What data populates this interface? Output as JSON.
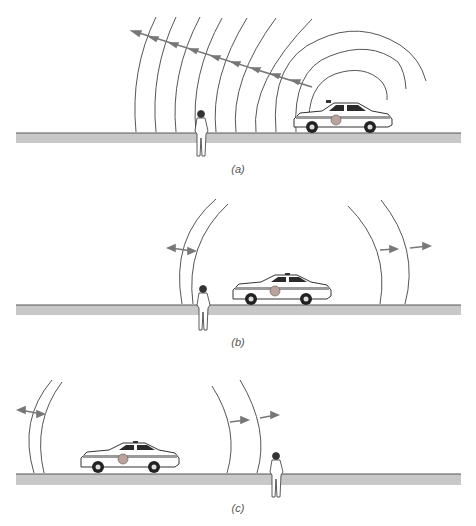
{
  "figure": {
    "colors": {
      "wave_line": "#555555",
      "arrow": "#777777",
      "ground_band": "#c8c8c8",
      "ground_edge": "#555555",
      "car_body": "#ffffff",
      "car_outline": "#333333",
      "car_window": "#2a2a2a",
      "car_stripe": "#9a9a9a",
      "car_emblem": "#b9a39a"
    },
    "panels": [
      {
        "id": "a",
        "caption": "(a)",
        "description": "Car on the right emitting concentric wavefronts; many wavefronts traveling left toward observer with arrows"
      },
      {
        "id": "b",
        "caption": "(b)",
        "description": "Car between wavefronts approaching observer; two wavefronts left, two wavefronts right, arrows outward"
      },
      {
        "id": "c",
        "caption": "(c)",
        "description": "Car has passed observer; two wavefronts left, two wavefronts right (near observer), arrows outward"
      }
    ]
  }
}
